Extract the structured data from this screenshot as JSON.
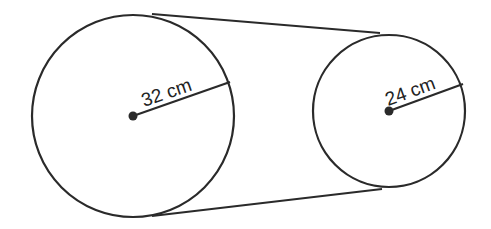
{
  "diagram": {
    "type": "belt-pulley",
    "stroke_color": "#2a2a2a",
    "large_circle": {
      "radius_label": "32 cm",
      "cx": 133,
      "cy": 116,
      "r": 102
    },
    "small_circle": {
      "radius_label": "24 cm",
      "cx": 389,
      "cy": 111,
      "r": 77
    },
    "belt": {
      "top": {
        "x1": 167,
        "y1": 15,
        "x2": 375,
        "y2": 32
      },
      "bottom": {
        "x1": 168,
        "y1": 214,
        "x2": 377,
        "y2": 190
      }
    }
  }
}
